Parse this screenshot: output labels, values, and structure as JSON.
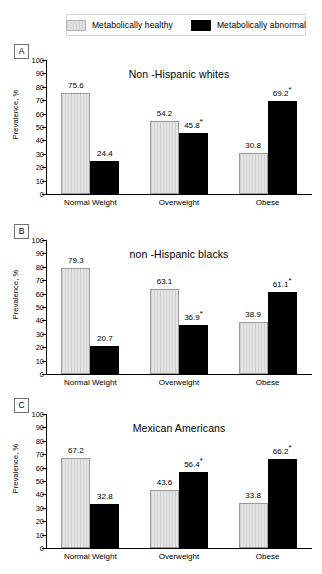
{
  "legend": {
    "items": [
      {
        "label": "Metabolically healthy",
        "swatch": "light-gray-hatched",
        "color": "#dcdcdc"
      },
      {
        "label": "Metabolically abnormal",
        "swatch": "black-solid",
        "color": "#000000"
      }
    ]
  },
  "axis": {
    "ylabel": "Prevalence, %",
    "yticks": [
      "0",
      "10",
      "20",
      "30",
      "40",
      "50",
      "60",
      "70",
      "80",
      "90",
      "100"
    ],
    "ymin": 0,
    "ymax": 100
  },
  "panels": [
    {
      "letter": "A",
      "title": "Non -Hispanic whites"
    },
    {
      "letter": "B",
      "title": "non -Hispanic blacks"
    },
    {
      "letter": "C",
      "title": "Mexican Americans"
    }
  ],
  "chart_data": [
    {
      "type": "bar",
      "panel": "A",
      "title": "Non -Hispanic whites",
      "xlabel": "",
      "ylabel": "Prevalence, %",
      "ylim": [
        0,
        100
      ],
      "grid": false,
      "legend_position": "top",
      "categories": [
        "Normal Weight",
        "Overweight",
        "Obese"
      ],
      "series": [
        {
          "name": "Metabolically healthy",
          "values": [
            75.6,
            54.2,
            30.8
          ],
          "labels": [
            "75.6",
            "54.2",
            "30.8"
          ]
        },
        {
          "name": "Metabolically abnormal",
          "values": [
            24.4,
            45.8,
            69.2
          ],
          "labels": [
            "24.4",
            "45.8*",
            "69.2*"
          ]
        }
      ]
    },
    {
      "type": "bar",
      "panel": "B",
      "title": "non -Hispanic blacks",
      "xlabel": "",
      "ylabel": "Prevalence, %",
      "ylim": [
        0,
        100
      ],
      "grid": false,
      "legend_position": "top",
      "categories": [
        "Normal Weight",
        "Overweight",
        "Obese"
      ],
      "series": [
        {
          "name": "Metabolically healthy",
          "values": [
            79.3,
            63.1,
            38.9
          ],
          "labels": [
            "79.3",
            "63.1",
            "38.9"
          ]
        },
        {
          "name": "Metabolically abnormal",
          "values": [
            20.7,
            36.9,
            61.1
          ],
          "labels": [
            "20.7",
            "36.9*",
            "61.1*"
          ]
        }
      ]
    },
    {
      "type": "bar",
      "panel": "C",
      "title": "Mexican Americans",
      "xlabel": "",
      "ylabel": "Prevalence, %",
      "ylim": [
        0,
        100
      ],
      "grid": false,
      "legend_position": "top",
      "categories": [
        "Normal Weight",
        "Overweight",
        "Obese"
      ],
      "series": [
        {
          "name": "Metabolically healthy",
          "values": [
            67.2,
            43.6,
            33.8
          ],
          "labels": [
            "67.2",
            "43.6",
            "33.8"
          ]
        },
        {
          "name": "Metabolically abnormal",
          "values": [
            32.8,
            56.4,
            66.2
          ],
          "labels": [
            "32.8",
            "56.4*",
            "66.2*"
          ]
        }
      ]
    }
  ]
}
